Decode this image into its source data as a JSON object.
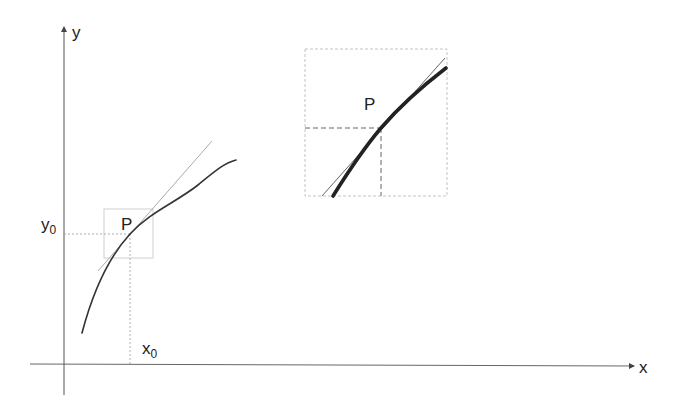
{
  "diagram": {
    "type": "tangent-line-local-linearity",
    "axes": {
      "x_label": "x",
      "y_label": "y"
    },
    "point": {
      "label": "P",
      "x_label_base": "x",
      "x_label_sub": "0",
      "y_label_base": "y",
      "y_label_sub": "0"
    },
    "inset": {
      "point_label": "P",
      "description": "magnified view of neighborhood around P"
    },
    "colors": {
      "axis": "#555555",
      "curve": "#333333",
      "tangent": "#aaaaaa",
      "guide": "#999999",
      "box": "#bbbbbb"
    }
  }
}
